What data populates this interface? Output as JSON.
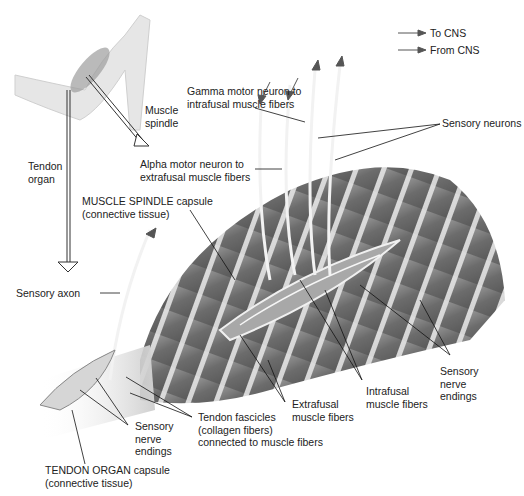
{
  "legend": {
    "items": [
      {
        "label": "To CNS",
        "icon": "arrow-right-icon"
      },
      {
        "label": "From CNS",
        "icon": "arrow-right-icon"
      }
    ]
  },
  "labels": {
    "muscle_spindle": [
      "Muscle",
      "spindle"
    ],
    "tendon_organ": [
      "Tendon",
      "organ"
    ],
    "gamma_motor": [
      "Gamma motor neuron to",
      "intrafusal muscle fibers"
    ],
    "sensory_neurons": "Sensory neurons",
    "alpha_motor": [
      "Alpha motor neuron to",
      "extrafusal muscle fibers"
    ],
    "spindle_capsule": [
      "MUSCLE SPINDLE capsule",
      "(connective tissue)"
    ],
    "sensory_axon": "Sensory axon",
    "sensory_endings_right": [
      "Sensory",
      "nerve",
      "endings"
    ],
    "intrafusal": [
      "Intrafusal",
      "muscle fibers"
    ],
    "extrafusal": [
      "Extrafusal",
      "muscle fibers"
    ],
    "tendon_fascicles": [
      "Tendon fascicles",
      "(collagen fibers)",
      "connected to muscle fibers"
    ],
    "sensory_endings_left": [
      "Sensory",
      "nerve",
      "endings"
    ],
    "tendon_capsule": [
      "TENDON ORGAN capsule",
      "(connective tissue)"
    ]
  },
  "colors": {
    "muscle_dark": "#6e6e6e",
    "muscle_mid": "#8a8a8a",
    "stripe": "#e6e6e6",
    "skin": "#e4e4e4",
    "line": "#111111"
  }
}
